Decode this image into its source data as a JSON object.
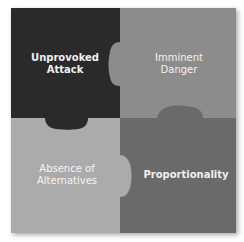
{
  "diagram": {
    "type": "puzzle-quadrants",
    "pieces": [
      {
        "id": "top-left",
        "label": "Unprovoked\nAttack",
        "color": "#2b2b2b",
        "text_color": "#f0f0f0"
      },
      {
        "id": "top-right",
        "label": "Imminent\nDanger",
        "color": "#8c8c8c",
        "text_color": "#f2f2f2"
      },
      {
        "id": "bottom-left",
        "label": "Absence of\nAlternatives",
        "color": "#ababab",
        "text_color": "#f4f4f4"
      },
      {
        "id": "bottom-right",
        "label": "Proportionality",
        "color": "#6b6b6b",
        "text_color": "#f0f0f0"
      }
    ]
  }
}
